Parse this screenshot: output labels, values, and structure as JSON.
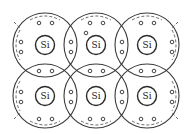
{
  "diagram": {
    "atom_label": "Si",
    "atoms": [
      {
        "label": "Si",
        "row": 0,
        "col": 0
      },
      {
        "label": "Si",
        "row": 0,
        "col": 1
      },
      {
        "label": "Si",
        "row": 0,
        "col": 2
      },
      {
        "label": "Si",
        "row": 1,
        "col": 0
      },
      {
        "label": "Si",
        "row": 1,
        "col": 1
      },
      {
        "label": "Si",
        "row": 1,
        "col": 2
      }
    ],
    "rows": 2,
    "cols": 3,
    "electrons_per_bond": 2,
    "colors": {
      "stroke": "#333333",
      "background": "#ffffff"
    }
  }
}
